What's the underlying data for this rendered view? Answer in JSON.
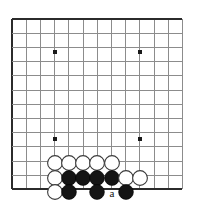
{
  "diagram": {
    "type": "go-board",
    "board": {
      "origin_x": 12,
      "origin_y": 19,
      "spacing": 14.2,
      "cols": 13,
      "rows": 13,
      "edges": [
        "left",
        "top",
        "bottom"
      ],
      "line_color": "#8c8c8c",
      "edge_color": "#2b2b2b"
    },
    "star_points": [
      {
        "name": "star-point-upper-left",
        "cx": 55,
        "cy": 52
      },
      {
        "name": "star-point-upper-right",
        "cx": 140,
        "cy": 52
      },
      {
        "name": "star-point-lower-left",
        "cx": 55,
        "cy": 139
      },
      {
        "name": "star-point-lower-right",
        "cx": 140,
        "cy": 139
      }
    ],
    "stones": [
      {
        "color": "white",
        "cx": 55,
        "cy": 163
      },
      {
        "color": "white",
        "cx": 69,
        "cy": 163
      },
      {
        "color": "white",
        "cx": 83,
        "cy": 163
      },
      {
        "color": "white",
        "cx": 97,
        "cy": 163
      },
      {
        "color": "white",
        "cx": 112,
        "cy": 163
      },
      {
        "color": "white",
        "cx": 55,
        "cy": 178
      },
      {
        "color": "black",
        "cx": 69,
        "cy": 178
      },
      {
        "color": "black",
        "cx": 83,
        "cy": 178
      },
      {
        "color": "black",
        "cx": 97,
        "cy": 178
      },
      {
        "color": "black",
        "cx": 112,
        "cy": 178
      },
      {
        "color": "white",
        "cx": 126,
        "cy": 178
      },
      {
        "color": "white",
        "cx": 140,
        "cy": 178
      },
      {
        "color": "white",
        "cx": 55,
        "cy": 192
      },
      {
        "color": "black",
        "cx": 69,
        "cy": 192
      },
      {
        "color": "black",
        "cx": 97,
        "cy": 192
      },
      {
        "color": "black",
        "cx": 126,
        "cy": 192
      }
    ],
    "stone_radius": 7.4,
    "markers": [
      {
        "label": "a",
        "cx": 112,
        "cy": 192
      }
    ]
  }
}
